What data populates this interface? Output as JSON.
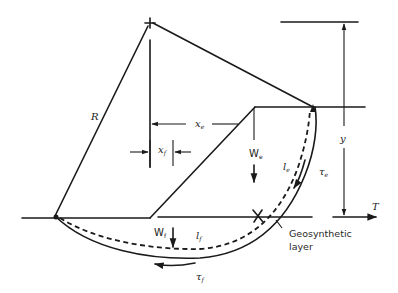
{
  "figure": {
    "type": "geotechnical-slip-circle-diagram"
  },
  "labels": {
    "radius": "R",
    "x_e": "x",
    "x_e_sub": "e",
    "x_f": "x",
    "x_f_sub": "f",
    "W_e": "W",
    "W_e_sub": "e",
    "W_f": "W",
    "W_f_sub": "f",
    "l_e": "l",
    "l_e_sub": "e",
    "l_f": "l",
    "l_f_sub": "f",
    "tau_e": "τ",
    "tau_e_sub": "e",
    "tau_f": "τ",
    "tau_f_sub": "f",
    "y": "y",
    "T": "T",
    "geosynthetic_line1": "Geosynthetic",
    "geosynthetic_line2": "layer"
  },
  "colors": {
    "line": "#1a1a1a",
    "background": "#ffffff"
  }
}
